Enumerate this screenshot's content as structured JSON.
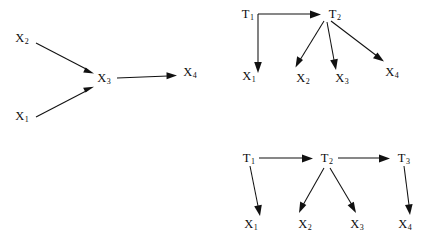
{
  "figure": {
    "background_color": "#ffffff",
    "ink_color": "#111111",
    "panels": [
      {
        "id": "panel-left",
        "name": "single-latent-chain-diagram",
        "nodes": [
          {
            "id": "x2",
            "base": "X",
            "sub": "2",
            "x": 22,
            "y": 42
          },
          {
            "id": "x1",
            "base": "X",
            "sub": "1",
            "x": 22,
            "y": 120
          },
          {
            "id": "x3",
            "base": "X",
            "sub": "3",
            "x": 104,
            "y": 82
          },
          {
            "id": "x4",
            "base": "X",
            "sub": "4",
            "x": 190,
            "y": 76
          }
        ],
        "edges": [
          {
            "id": "e-x2-x3",
            "from": "x2",
            "to": "x3",
            "type": "straight"
          },
          {
            "id": "e-x1-x3",
            "from": "x1",
            "to": "x3",
            "type": "straight"
          },
          {
            "id": "e-x3-x4",
            "from": "x3",
            "to": "x4",
            "type": "straight"
          }
        ]
      },
      {
        "id": "panel-top-right",
        "name": "two-period-latent-diagram",
        "nodes": [
          {
            "id": "t1",
            "base": "T",
            "sub": "1",
            "x": 248,
            "y": 18
          },
          {
            "id": "t2",
            "base": "T",
            "sub": "2",
            "x": 335,
            "y": 18
          },
          {
            "id": "x1",
            "base": "X",
            "sub": "1",
            "x": 249,
            "y": 80
          },
          {
            "id": "x2",
            "base": "X",
            "sub": "2",
            "x": 303,
            "y": 82
          },
          {
            "id": "x3",
            "base": "X",
            "sub": "3",
            "x": 342,
            "y": 82
          },
          {
            "id": "x4",
            "base": "X",
            "sub": "4",
            "x": 392,
            "y": 76
          }
        ],
        "edges": [
          {
            "id": "e-t1-t2",
            "from": "t1",
            "to": "t2",
            "type": "horizontal"
          },
          {
            "id": "e-t1-x1",
            "from": "t1",
            "to": "x1",
            "type": "elbow"
          },
          {
            "id": "e-t2-x2",
            "from": "t2",
            "to": "x2",
            "type": "straight"
          },
          {
            "id": "e-t2-x3",
            "from": "t2",
            "to": "x3",
            "type": "straight"
          },
          {
            "id": "e-t2-x4",
            "from": "t2",
            "to": "x4",
            "type": "straight"
          }
        ]
      },
      {
        "id": "panel-bottom-right",
        "name": "three-period-latent-diagram",
        "nodes": [
          {
            "id": "t1",
            "base": "T",
            "sub": "1",
            "x": 249,
            "y": 162
          },
          {
            "id": "t2",
            "base": "T",
            "sub": "2",
            "x": 327,
            "y": 162
          },
          {
            "id": "t3",
            "base": "T",
            "sub": "3",
            "x": 404,
            "y": 162
          },
          {
            "id": "x1",
            "base": "X",
            "sub": "1",
            "x": 251,
            "y": 228
          },
          {
            "id": "x2",
            "base": "X",
            "sub": "2",
            "x": 305,
            "y": 228
          },
          {
            "id": "x3",
            "base": "X",
            "sub": "3",
            "x": 357,
            "y": 228
          },
          {
            "id": "x4",
            "base": "X",
            "sub": "4",
            "x": 405,
            "y": 228
          }
        ],
        "edges": [
          {
            "id": "e-t1-t2",
            "from": "t1",
            "to": "t2",
            "type": "horizontal"
          },
          {
            "id": "e-t2-t3",
            "from": "t2",
            "to": "t3",
            "type": "horizontal"
          },
          {
            "id": "e-t1-x1",
            "from": "t1",
            "to": "x1",
            "type": "straight"
          },
          {
            "id": "e-t2-x2",
            "from": "t2",
            "to": "x2",
            "type": "straight"
          },
          {
            "id": "e-t2-x3",
            "from": "t2",
            "to": "x3",
            "type": "straight"
          },
          {
            "id": "e-t3-x4",
            "from": "t3",
            "to": "x4",
            "type": "straight"
          }
        ]
      }
    ]
  },
  "chart_data": {
    "type": "diagram",
    "title": "",
    "subtitle": "",
    "diagram_kind": "directed-acyclic-graph",
    "panel_count": 3,
    "panels": [
      {
        "label": "left",
        "nodes": [
          "X1",
          "X2",
          "X3",
          "X4"
        ],
        "directed_edges": [
          [
            "X2",
            "X3"
          ],
          [
            "X1",
            "X3"
          ],
          [
            "X3",
            "X4"
          ]
        ]
      },
      {
        "label": "top-right",
        "nodes": [
          "T1",
          "T2",
          "X1",
          "X2",
          "X3",
          "X4"
        ],
        "directed_edges": [
          [
            "T1",
            "T2"
          ],
          [
            "T1",
            "X1"
          ],
          [
            "T2",
            "X2"
          ],
          [
            "T2",
            "X3"
          ],
          [
            "T2",
            "X4"
          ]
        ]
      },
      {
        "label": "bottom-right",
        "nodes": [
          "T1",
          "T2",
          "T3",
          "X1",
          "X2",
          "X3",
          "X4"
        ],
        "directed_edges": [
          [
            "T1",
            "T2"
          ],
          [
            "T2",
            "T3"
          ],
          [
            "T1",
            "X1"
          ],
          [
            "T2",
            "X2"
          ],
          [
            "T2",
            "X3"
          ],
          [
            "T3",
            "X4"
          ]
        ]
      }
    ]
  }
}
